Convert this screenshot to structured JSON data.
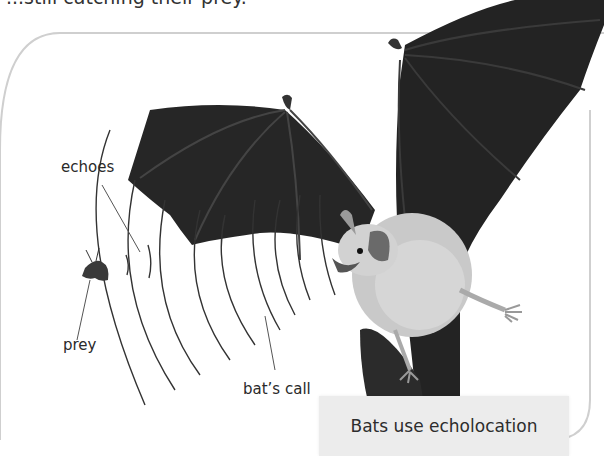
{
  "intro_text_fragment": "...still catching their prey.",
  "labels": {
    "echoes": "echoes",
    "prey": "prey",
    "bats_call": "bat’s call"
  },
  "caption": {
    "text": "Bats use echolocation"
  },
  "illustration": {
    "subject": "bat",
    "elements": [
      "bat",
      "moth prey",
      "sound waves (call)",
      "echo waves"
    ],
    "colors": {
      "wing": "#232323",
      "body": "#c9c9c9",
      "ear": "#6a6a6a",
      "wave_line": "#333333",
      "frame_border": "#cfcfcf",
      "caption_bg": "#ececec"
    }
  }
}
